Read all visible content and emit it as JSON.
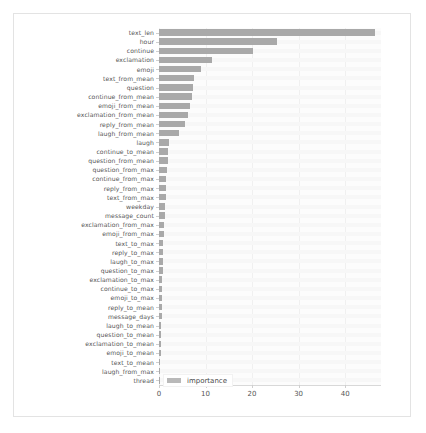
{
  "chart_data": {
    "type": "bar",
    "orientation": "horizontal",
    "title": "",
    "xlabel": "",
    "ylabel": "",
    "xlim": [
      0,
      47.7
    ],
    "ylim": [
      0,
      38
    ],
    "grid": true,
    "legend": {
      "position": "bottom-left",
      "entries": [
        {
          "name": "importance",
          "color": "#a9a9a9"
        }
      ]
    },
    "xticks": [
      0,
      10,
      20,
      30,
      40
    ],
    "xticklabels": [
      "0",
      "10",
      "20",
      "30",
      "40"
    ],
    "series": [
      {
        "name": "importance",
        "color": "#a9a9a9"
      }
    ],
    "categories": [
      "text_len",
      "hour",
      "continue",
      "exclamation",
      "emoji",
      "text_from_mean",
      "question",
      "continue_from_mean",
      "emoji_from_mean",
      "exclamation_from_mean",
      "reply_from_mean",
      "laugh_from_mean",
      "laugh",
      "continue_to_mean",
      "question_from_mean",
      "question_from_max",
      "continue_from_max",
      "reply_from_max",
      "text_from_max",
      "weekday",
      "message_count",
      "exclamation_from_max",
      "emoji_from_max",
      "text_to_max",
      "reply_to_max",
      "laugh_to_max",
      "question_to_max",
      "exclamation_to_max",
      "continue_to_max",
      "emoji_to_max",
      "reply_to_mean",
      "message_days",
      "laugh_to_mean",
      "question_to_mean",
      "exclamation_to_mean",
      "emoji_to_mean",
      "text_to_mean",
      "laugh_from_max",
      "thread"
    ],
    "values": [
      46.5,
      25.3,
      20.1,
      11.4,
      9.0,
      7.6,
      7.3,
      7.1,
      6.6,
      6.3,
      5.6,
      4.4,
      2.2,
      2.0,
      1.9,
      1.7,
      1.6,
      1.5,
      1.4,
      1.3,
      1.2,
      1.1,
      1.0,
      0.95,
      0.9,
      0.85,
      0.8,
      0.75,
      0.7,
      0.65,
      0.6,
      0.55,
      0.5,
      0.45,
      0.4,
      0.35,
      0.3,
      0.25,
      0.15
    ]
  }
}
